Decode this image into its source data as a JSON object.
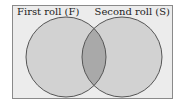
{
  "diagram": {
    "type": "venn",
    "sets": [
      {
        "id": "F",
        "label": "First roll (F)"
      },
      {
        "id": "S",
        "label": "Second roll (S)"
      }
    ],
    "intersection": {
      "sets": [
        "F",
        "S"
      ],
      "shaded": true
    },
    "colors": {
      "background": "#ececec",
      "circle_fill": "#d2d2d2",
      "intersection_fill": "#a9a9a9",
      "stroke": "#555555",
      "frame_border": "#8a8a8a"
    }
  }
}
